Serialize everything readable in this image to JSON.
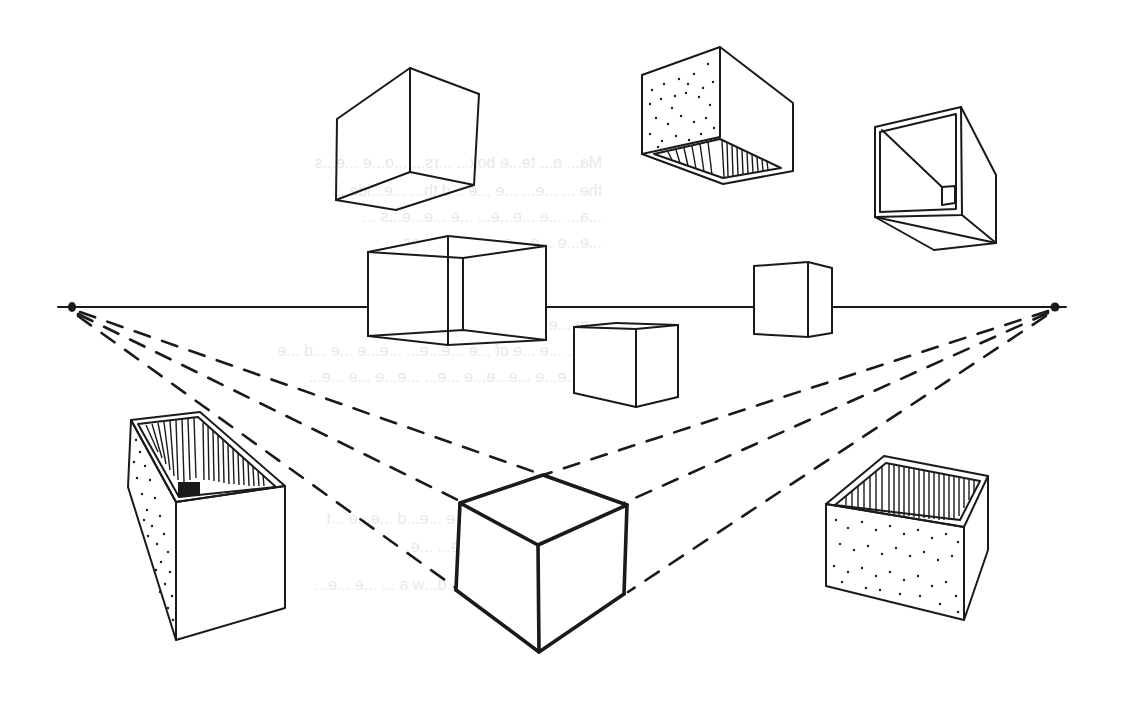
{
  "figure": {
    "type": "perspective-drawing",
    "colors": {
      "ink": "#1a1a1a",
      "paper": "#ffffff",
      "bleed_through": "#e9e9e9"
    }
  },
  "horizon": {
    "y": 307,
    "x_start": 58,
    "x_end": 1066
  },
  "vanishing_points": [
    {
      "name": "left-vanishing-point",
      "x": 72,
      "y": 307
    },
    {
      "name": "right-vanishing-point",
      "x": 1055,
      "y": 307
    }
  ],
  "objects": [
    {
      "name": "floating-cube-top-left",
      "style": "outline",
      "position": "above horizon"
    },
    {
      "name": "floating-box-top-middle",
      "style": "stippled side, hatched open bottom",
      "position": "above horizon"
    },
    {
      "name": "floating-open-box-top-right",
      "style": "open end showing interior",
      "position": "above horizon"
    },
    {
      "name": "transparent-cube",
      "style": "wireframe with hidden edges",
      "position": "straddling horizon"
    },
    {
      "name": "small-cube-right",
      "style": "outline",
      "position": "straddling horizon"
    },
    {
      "name": "small-cube-center",
      "style": "outline",
      "position": "below horizon"
    },
    {
      "name": "open-box-bottom-left",
      "style": "stippled side, hatched interior",
      "position": "below horizon"
    },
    {
      "name": "main-cube",
      "style": "bold outline with construction lines",
      "position": "below horizon"
    },
    {
      "name": "open-box-bottom-right",
      "style": "stippled front, hatched interior",
      "position": "below horizon"
    }
  ],
  "construction_lines": {
    "style": "dashed",
    "from_left_vp": 3,
    "from_right_vp": 3
  },
  "bleed_through_text": [
    "Ma... a... te...e box... ...rs... ...o...e ...e...s",
    "the ... ...e... ...e ...e ...d th... ...e...ide ...",
    "...a... ...e ...e...e... ...e ...e...e...s ...",
    "...e...e ...e ...e ...e ...e... ...es.",
    "...m ...e to... ...e...e ...e... ...a...e",
    "...e... ...e ...e of ...e ...e...e... ...e...e ...e ...d ...e",
    "...e...e...e ...e...e...e ...e... ...e...e ...e ...e...",
    "...e ... ...e ...e...e... ...e ...e...d ...e...e ...t",
    "...e...e... ...e... ...e ...e... ...e.",
    "...m ...e ...e...g ...o...t, d...w a ... ...e ...e..."
  ]
}
